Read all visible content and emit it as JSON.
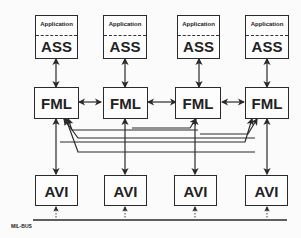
{
  "diagram": {
    "nodes": {
      "ass": [
        {
          "app_label": "Application",
          "label": "ASS"
        },
        {
          "app_label": "Application",
          "label": "ASS"
        },
        {
          "app_label": "Application",
          "label": "ASS"
        },
        {
          "app_label": "Application",
          "label": "ASS"
        }
      ],
      "fml": [
        {
          "label": "FML"
        },
        {
          "label": "FML"
        },
        {
          "label": "FML"
        },
        {
          "label": "FML"
        }
      ],
      "avi": [
        {
          "label": "AVI"
        },
        {
          "label": "AVI"
        },
        {
          "label": "AVI"
        },
        {
          "label": "AVI"
        }
      ]
    },
    "bus": {
      "label": "MIL-BUS"
    },
    "edges": [
      "ASS1<->FML1",
      "ASS2<->FML2",
      "ASS3<->FML3",
      "ASS4<->FML4",
      "FML1<->FML2",
      "FML2<->FML3",
      "FML3<->FML4",
      "FML1<->AVI1",
      "FML2<->AVI2",
      "FML3<->AVI3",
      "FML4<->AVI4",
      "AVI2->FML1",
      "AVI3->FML1",
      "AVI4->FML1",
      "AVI1->FML4",
      "AVI2->FML4",
      "AVI3->FML4",
      "AVI1..MIL-BUS",
      "AVI2..MIL-BUS",
      "AVI3..MIL-BUS",
      "AVI4..MIL-BUS"
    ],
    "colors": {
      "line": "#2a2a2a",
      "background": "#fbfbfb"
    }
  }
}
